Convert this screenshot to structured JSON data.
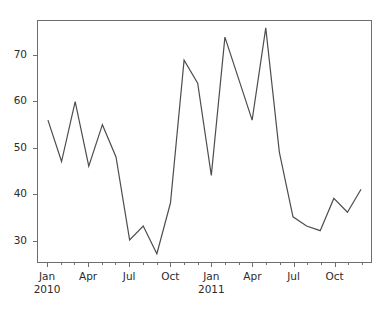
{
  "chart_data": {
    "type": "line",
    "title": "",
    "xlabel": "",
    "ylabel": "",
    "grid": false,
    "legend": null,
    "ylim": [
      25.2,
      77.5
    ],
    "yticks": [
      30,
      40,
      50,
      60,
      70
    ],
    "ytick_labels": [
      "30",
      "40",
      "50",
      "60",
      "70"
    ],
    "x_major_ticks": [
      {
        "label": "Jan",
        "year": "2010",
        "index": 0
      },
      {
        "label": "Apr",
        "year": "",
        "index": 3
      },
      {
        "label": "Jul",
        "year": "",
        "index": 6
      },
      {
        "label": "Oct",
        "year": "",
        "index": 9
      },
      {
        "label": "Jan",
        "year": "2011",
        "index": 12
      },
      {
        "label": "Apr",
        "year": "",
        "index": 15
      },
      {
        "label": "Jul",
        "year": "",
        "index": 18
      },
      {
        "label": "Oct",
        "year": "",
        "index": 21
      }
    ],
    "x": [
      "2010-01",
      "2010-02",
      "2010-03",
      "2010-04",
      "2010-05",
      "2010-06",
      "2010-07",
      "2010-08",
      "2010-09",
      "2010-10",
      "2010-11",
      "2010-12",
      "2011-01",
      "2011-02",
      "2011-03",
      "2011-04",
      "2011-05",
      "2011-06",
      "2011-07",
      "2011-08",
      "2011-09",
      "2011-10",
      "2011-11",
      "2011-12"
    ],
    "categories": [
      "Jan 2010",
      "Feb 2010",
      "Mar 2010",
      "Apr 2010",
      "May 2010",
      "Jun 2010",
      "Jul 2010",
      "Aug 2010",
      "Sep 2010",
      "Oct 2010",
      "Nov 2010",
      "Dec 2010",
      "Jan 2011",
      "Feb 2011",
      "Mar 2011",
      "Apr 2011",
      "May 2011",
      "Jun 2011",
      "Jul 2011",
      "Aug 2011",
      "Sep 2011",
      "Oct 2011",
      "Nov 2011",
      "Dec 2011"
    ],
    "values": [
      56,
      47,
      60,
      46,
      55,
      48,
      30,
      33,
      27,
      38,
      69,
      64,
      44,
      74,
      65,
      56,
      76,
      49,
      35,
      33,
      32,
      39,
      36,
      41
    ],
    "series": [
      {
        "name": "series-1",
        "color": "#4d4d4d",
        "line_width": 1.2,
        "values": [
          56,
          47,
          60,
          46,
          55,
          48,
          30,
          33,
          27,
          38,
          69,
          64,
          44,
          74,
          65,
          56,
          76,
          49,
          35,
          33,
          32,
          39,
          36,
          41
        ]
      }
    ]
  },
  "axes": {
    "spine_color": "#6e6e6e",
    "tick_color": "#6e6e6e",
    "label_color": "#2b2b2b",
    "background": "#ffffff"
  }
}
